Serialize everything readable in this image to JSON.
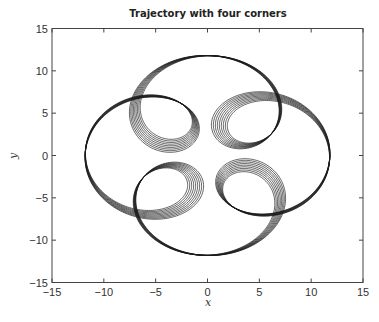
{
  "chart_data": {
    "type": "line",
    "title": "Trajectory with four corners",
    "xlabel": "x",
    "ylabel": "y",
    "xlim": [
      -15,
      15
    ],
    "ylim": [
      -15,
      15
    ],
    "xticks": [
      -15,
      -10,
      -5,
      0,
      5,
      10,
      15
    ],
    "yticks": [
      -15,
      -10,
      -5,
      0,
      5,
      10,
      15
    ],
    "xtick_labels": [
      "−15",
      "−10",
      "−5",
      "0",
      "5",
      "10",
      "15"
    ],
    "ytick_labels": [
      "−15",
      "−10",
      "−5",
      "0",
      "5",
      "10",
      "15"
    ],
    "grid": false,
    "legend": null,
    "line_color": "#1a1a1a",
    "series": [
      {
        "name": "trajectory",
        "description": "Quasi-periodic closed-band orbit with four bow-shaped loops at the corners (top, bottom, left, right) around a central rounded-square hole",
        "loops": [
          {
            "position": "top",
            "crossing": [
              0,
              7.5
            ],
            "extent_max_y": 12.5,
            "x_range": [
              -2.7,
              2.7
            ]
          },
          {
            "position": "bottom",
            "crossing": [
              0,
              -7.5
            ],
            "extent_min_y": -11.6,
            "x_range": [
              -2.7,
              2.7
            ]
          },
          {
            "position": "left",
            "crossing": [
              -7.5,
              0
            ],
            "extent_min_x": -12.6,
            "y_range": [
              -2.5,
              2.5
            ]
          },
          {
            "position": "right",
            "crossing": [
              7.5,
              0
            ],
            "extent_max_x": 12.2,
            "y_range": [
              -2.5,
              2.5
            ]
          }
        ],
        "inner_hole_approx": {
          "x_range": [
            -4.5,
            4.5
          ],
          "y_range": [
            -4.5,
            4.5
          ]
        },
        "generator": {
          "A": 7.2,
          "B": 4.6,
          "harmonic": 5,
          "strands": 9,
          "spread": 0.07
        }
      }
    ]
  }
}
